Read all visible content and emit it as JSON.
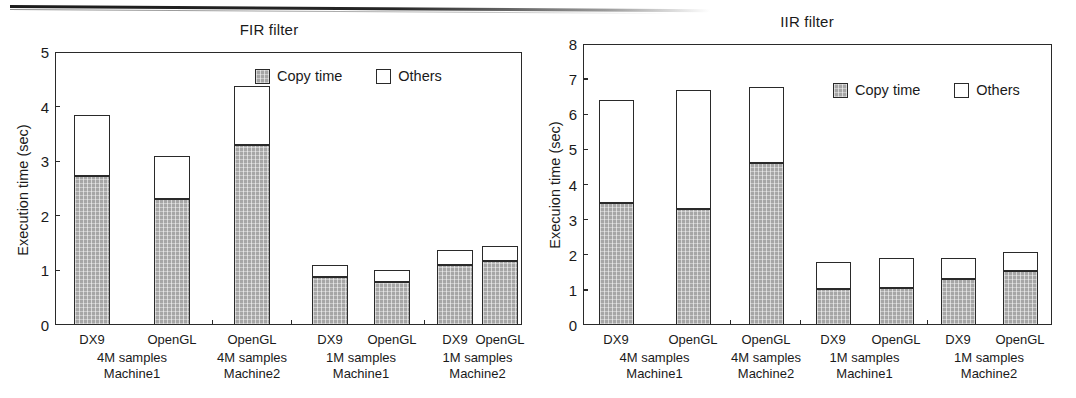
{
  "page": {
    "background": "#ffffff",
    "ink": "#1a1a1a",
    "copy_fill": "#a6a6a6",
    "others_fill": "#ffffff"
  },
  "charts": [
    {
      "id": "fir",
      "title": "FIR filter",
      "ylabel": "Execution time (sec)",
      "yticks": [
        "0",
        "1",
        "2",
        "3",
        "4",
        "5"
      ],
      "legend": {
        "copy": "Copy time",
        "others": "Others"
      },
      "chart_data": {
        "type": "bar",
        "subtype": "stacked-vertical",
        "title": "FIR filter",
        "xlabel": "",
        "ylabel": "Execution time (sec)",
        "ylim": [
          0,
          5
        ],
        "ytick_values": [
          0,
          1,
          2,
          3,
          4,
          5
        ],
        "grid": false,
        "legend_position": "top-right",
        "categories": [
          "DX9",
          "OpenGL",
          "OpenGL",
          "DX9",
          "OpenGL",
          "DX9",
          "OpenGL"
        ],
        "groups": [
          {
            "label": "4M samples\nMachine1",
            "line1": "4M samples",
            "line2": "Machine1",
            "members": [
              0,
              1
            ]
          },
          {
            "label": "4M samples\nMachine2",
            "line1": "4M samples",
            "line2": "Machine2",
            "members": [
              2
            ]
          },
          {
            "label": "1M samples\nMachine1",
            "line1": "1M samples",
            "line2": "Machine1",
            "members": [
              3,
              4
            ]
          },
          {
            "label": "1M samples\nMachine2",
            "line1": "1M samples",
            "line2": "Machine2",
            "members": [
              5,
              6
            ]
          }
        ],
        "series": [
          {
            "name": "Copy time",
            "values": [
              2.72,
              2.3,
              3.3,
              0.88,
              0.78,
              1.1,
              1.17
            ]
          },
          {
            "name": "Others",
            "values": [
              1.13,
              0.8,
              1.07,
              0.22,
              0.22,
              0.28,
              0.28
            ]
          }
        ],
        "totals": [
          3.85,
          3.1,
          4.37,
          1.1,
          1.0,
          1.38,
          1.45
        ]
      }
    },
    {
      "id": "iir",
      "title": "IIR filter",
      "ylabel": "Execuion time (sec)",
      "yticks": [
        "0",
        "1",
        "2",
        "3",
        "4",
        "5",
        "6",
        "7",
        "8"
      ],
      "legend": {
        "copy": "Copy time",
        "others": "Others"
      },
      "chart_data": {
        "type": "bar",
        "subtype": "stacked-vertical",
        "title": "IIR filter",
        "xlabel": "",
        "ylabel": "Execuion time (sec)",
        "ylim": [
          0,
          8
        ],
        "ytick_values": [
          0,
          1,
          2,
          3,
          4,
          5,
          6,
          7,
          8
        ],
        "grid": false,
        "legend_position": "top-right",
        "categories": [
          "DX9",
          "OpenGL",
          "OpenGL",
          "DX9",
          "OpenGL",
          "DX9",
          "OpenGL"
        ],
        "groups": [
          {
            "label": "4M samples\nMachine1",
            "line1": "4M samples",
            "line2": "Machine1",
            "members": [
              0,
              1
            ]
          },
          {
            "label": "4M samples\nMachine2",
            "line1": "4M samples",
            "line2": "Machine2",
            "members": [
              2
            ]
          },
          {
            "label": "1M samples\nMachine1",
            "line1": "1M samples",
            "line2": "Machine1",
            "members": [
              3,
              4
            ]
          },
          {
            "label": "1M samples\nMachine2",
            "line1": "1M samples",
            "line2": "Machine2",
            "members": [
              5,
              6
            ]
          }
        ],
        "series": [
          {
            "name": "Copy time",
            "values": [
              3.48,
              3.3,
              4.6,
              1.02,
              1.05,
              1.32,
              1.53
            ]
          },
          {
            "name": "Others",
            "values": [
              2.92,
              3.38,
              2.18,
              0.78,
              0.85,
              0.58,
              0.55
            ]
          }
        ],
        "totals": [
          6.4,
          6.68,
          6.78,
          1.8,
          1.9,
          1.9,
          2.08
        ]
      }
    }
  ]
}
